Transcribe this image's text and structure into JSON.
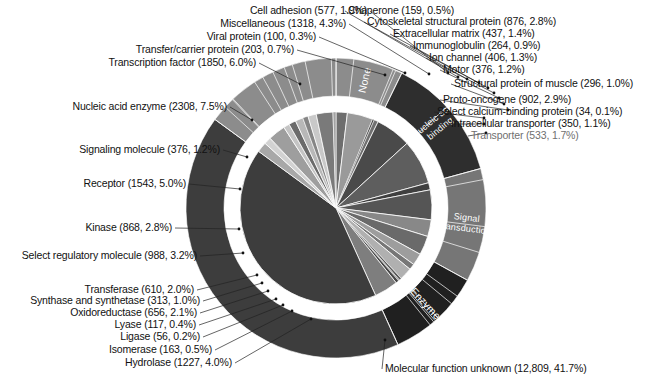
{
  "figure": {
    "title": "",
    "center": {
      "x": 336,
      "y": 208
    },
    "radii": {
      "pie": 96,
      "ring_inner": 112,
      "ring_outer": 150
    },
    "background": "#ffffff",
    "text_color": "#111111"
  },
  "ring_groups": [
    {
      "label": "None",
      "color": "#8c8c8c",
      "text_color": "#ffffff"
    },
    {
      "label": "Nucleic acid binding",
      "color": "#2e2e2e",
      "text_color": "#ffffff"
    },
    {
      "label": "Signal transduction",
      "color": "#767676",
      "text_color": "#ffffff"
    },
    {
      "label": "Enzyme",
      "color": "#202020",
      "text_color": "#ffffff"
    }
  ],
  "chart_data": {
    "type": "pie",
    "total": 30700,
    "value_label_format": "(count, percent)",
    "start_angle_deg": -90,
    "direction": "clockwise",
    "legend": "inline-leader-lines",
    "grid": false,
    "categories": [
      "Cell adhesion",
      "Miscellaneous",
      "Viral protein",
      "Transfer/carrier protein",
      "Transcription factor",
      "Nucleic acid enzyme",
      "Signaling molecule",
      "Receptor",
      "Kinase",
      "Select regulatory molecule",
      "Transferase",
      "Synthase and synthetase",
      "Oxidoreductase",
      "Lyase",
      "Ligase",
      "Isomerase",
      "Hydrolase",
      "Molecular function unknown",
      "Transporter",
      "Intracellular transporter",
      "Select calcium-binding protein",
      "Proto-oncogene",
      "Structural protein of muscle",
      "Motor",
      "Ion channel",
      "Immunoglobulin",
      "Extracellular matrix",
      "Cytoskeletal structural protein",
      "Chaperone"
    ],
    "values": [
      577,
      1318,
      100,
      203,
      1850,
      2308,
      376,
      1543,
      868,
      988,
      610,
      313,
      656,
      117,
      56,
      163,
      1227,
      12809,
      533,
      350,
      34,
      902,
      296,
      376,
      406,
      264,
      437,
      876,
      159
    ],
    "percents": [
      1.9,
      4.3,
      0.3,
      0.7,
      6.0,
      7.5,
      1.2,
      5.0,
      2.8,
      3.2,
      2.0,
      1.0,
      2.1,
      0.4,
      0.2,
      0.5,
      4.0,
      41.7,
      1.7,
      1.1,
      0.1,
      2.9,
      1.0,
      1.2,
      1.3,
      0.9,
      1.4,
      2.8,
      0.5
    ],
    "slices": [
      {
        "name": "Cell adhesion",
        "value": 577,
        "percent": 1.9,
        "color": "#6e6e6e",
        "group": "None",
        "label": "Cell adhesion (577, 1.9%)"
      },
      {
        "name": "Miscellaneous",
        "value": 1318,
        "percent": 4.3,
        "color": "#9a9a9a",
        "group": "None",
        "label": "Miscellaneous (1318, 4.3%)"
      },
      {
        "name": "Viral protein",
        "value": 100,
        "percent": 0.3,
        "color": "#3a3a3a",
        "group": "None",
        "label": "Viral protein (100, 0.3%)"
      },
      {
        "name": "Transfer/carrier protein",
        "value": 203,
        "percent": 0.7,
        "color": "#707070",
        "group": "None",
        "label": "Transfer/carrier protein (203, 0.7%)"
      },
      {
        "name": "Transcription factor",
        "value": 1850,
        "percent": 6.0,
        "color": "#4a4a4a",
        "group": "Nucleic acid binding",
        "label": "Transcription factor (1850, 6.0%)"
      },
      {
        "name": "Nucleic acid enzyme",
        "value": 2308,
        "percent": 7.5,
        "color": "#5e5e5e",
        "group": "Nucleic acid binding",
        "label": "Nucleic acid enzyme (2308, 7.5%)"
      },
      {
        "name": "Signaling molecule",
        "value": 376,
        "percent": 1.2,
        "color": "#3f3f3f",
        "group": "Signal transduction",
        "label": "Signaling molecule (376, 1.2%)"
      },
      {
        "name": "Receptor",
        "value": 1543,
        "percent": 5.0,
        "color": "#555555",
        "group": "Signal transduction",
        "label": "Receptor (1543, 5.0%)"
      },
      {
        "name": "Kinase",
        "value": 868,
        "percent": 2.8,
        "color": "#888888",
        "group": "Signal transduction",
        "label": "Kinase (868, 2.8%)"
      },
      {
        "name": "Select regulatory molecule",
        "value": 988,
        "percent": 3.2,
        "color": "#6a6a6a",
        "group": "Signal transduction",
        "label": "Select regulatory molecule (988, 3.2%)"
      },
      {
        "name": "Transferase",
        "value": 610,
        "percent": 2.0,
        "color": "#9d9d9d",
        "group": "Enzyme",
        "label": "Transferase (610, 2.0%)"
      },
      {
        "name": "Synthase and synthetase",
        "value": 313,
        "percent": 1.0,
        "color": "#777777",
        "group": "Enzyme",
        "label": "Synthase and synthetase (313, 1.0%)"
      },
      {
        "name": "Oxidoreductase",
        "value": 656,
        "percent": 2.1,
        "color": "#b0b0b0",
        "group": "Enzyme",
        "label": "Oxidoreductase (656, 2.1%)"
      },
      {
        "name": "Lyase",
        "value": 117,
        "percent": 0.4,
        "color": "#5a5a5a",
        "group": "Enzyme",
        "label": "Lyase (117, 0.4%)"
      },
      {
        "name": "Ligase",
        "value": 56,
        "percent": 0.2,
        "color": "#8e8e8e",
        "group": "Enzyme",
        "label": "Ligase (56, 0.2%)"
      },
      {
        "name": "Isomerase",
        "value": 163,
        "percent": 0.5,
        "color": "#454545",
        "group": "Enzyme",
        "label": "Isomerase (163, 0.5%)"
      },
      {
        "name": "Hydrolase",
        "value": 1227,
        "percent": 4.0,
        "color": "#7e7e7e",
        "group": "Enzyme",
        "label": "Hydrolase (1227, 4.0%)"
      },
      {
        "name": "Molecular function unknown",
        "value": 12809,
        "percent": 41.7,
        "color": "#3d3d3d",
        "group": "",
        "label": "Molecular function unknown (12,809, 41.7%)"
      },
      {
        "name": "Transporter",
        "value": 533,
        "percent": 1.7,
        "color": "#a8a8a8",
        "group": "None",
        "label": "Transporter (533, 1.7%)"
      },
      {
        "name": "Intracellular transporter",
        "value": 350,
        "percent": 1.1,
        "color": "#d2d2d2",
        "group": "None",
        "label": "Intracellular transporter (350, 1.1%)"
      },
      {
        "name": "Select calcium-binding protein",
        "value": 34,
        "percent": 0.1,
        "color": "#5d5d5d",
        "group": "None",
        "label": "Select calcium-binding protein (34, 0.1%)"
      },
      {
        "name": "Proto-oncogene",
        "value": 902,
        "percent": 2.9,
        "color": "#9e9e9e",
        "group": "None",
        "label": "Proto-oncogene (902, 2.9%)"
      },
      {
        "name": "Structural protein of muscle",
        "value": 296,
        "percent": 1.0,
        "color": "#c4c4c4",
        "group": "None",
        "label": "Structural protein of muscle (296, 1.0%)"
      },
      {
        "name": "Motor",
        "value": 376,
        "percent": 1.2,
        "color": "#6b6b6b",
        "group": "None",
        "label": "Motor (376, 1.2%)"
      },
      {
        "name": "Ion channel",
        "value": 406,
        "percent": 1.3,
        "color": "#b8b8b8",
        "group": "None",
        "label": "Ion channel (406, 1.3%)"
      },
      {
        "name": "Immunoglobulin",
        "value": 264,
        "percent": 0.9,
        "color": "#858585",
        "group": "None",
        "label": "Immunoglobulin (264, 0.9%)"
      },
      {
        "name": "Extracellular matrix",
        "value": 437,
        "percent": 1.4,
        "color": "#c9c9c9",
        "group": "None",
        "label": "Extracellular matrix (437, 1.4%)"
      },
      {
        "name": "Cytoskeletal structural protein",
        "value": 876,
        "percent": 2.8,
        "color": "#7a7a7a",
        "group": "None",
        "label": "Cytoskeletal structural protein (876, 2.8%)"
      },
      {
        "name": "Chaperone",
        "value": 159,
        "percent": 0.5,
        "color": "#a3a3a3",
        "group": "None",
        "label": "Chaperone (159, 0.5%)"
      }
    ]
  },
  "labels": {
    "top_left": [
      {
        "text": "Cell adhesion (577, 1.9%)",
        "x": 367,
        "y": 5,
        "align": "right",
        "anchor": {
          "x": 448,
          "y": 73
        }
      },
      {
        "text": "Miscellaneous (1318, 4.3%)",
        "x": 346,
        "y": 18,
        "align": "right",
        "anchor": {
          "x": 429,
          "y": 74
        }
      },
      {
        "text": "Viral protein (100, 0.3%)",
        "x": 316,
        "y": 31,
        "align": "right",
        "anchor": {
          "x": 405,
          "y": 73
        }
      },
      {
        "text": "Transfer/carrier protein (203, 0.7%)",
        "x": 294,
        "y": 44,
        "align": "right",
        "anchor": {
          "x": 385,
          "y": 75
        }
      },
      {
        "text": "Transcription factor (1850, 6.0%)",
        "x": 256,
        "y": 57,
        "align": "right",
        "anchor": {
          "x": 300,
          "y": 84
        }
      }
    ],
    "left": [
      {
        "text": "Nucleic acid enzyme (2308, 7.5%)",
        "x": 227,
        "y": 101,
        "align": "right",
        "anchor": {
          "x": 252,
          "y": 120
        }
      },
      {
        "text": "Signaling molecule (376, 1.2%)",
        "x": 220,
        "y": 144,
        "align": "right",
        "anchor": {
          "x": 247,
          "y": 157
        }
      },
      {
        "text": "Receptor (1543, 5.0%)",
        "x": 186,
        "y": 178,
        "align": "right",
        "anchor": {
          "x": 240,
          "y": 189
        }
      },
      {
        "text": "Kinase (868, 2.8%)",
        "x": 172,
        "y": 222,
        "align": "right",
        "anchor": {
          "x": 239,
          "y": 229
        }
      },
      {
        "text": "Select regulatory molecule (988, 3.2%)",
        "x": 197,
        "y": 250,
        "align": "right",
        "anchor": {
          "x": 243,
          "y": 253
        }
      }
    ],
    "bottom_left": [
      {
        "text": "Transferase (610, 2.0%)",
        "x": 194,
        "y": 284,
        "align": "right",
        "anchor": {
          "x": 257,
          "y": 275
        }
      },
      {
        "text": "Synthase and synthetase (313, 1.0%)",
        "x": 200,
        "y": 295,
        "align": "right",
        "anchor": {
          "x": 262,
          "y": 283
        }
      },
      {
        "text": "Oxidoreductase (656, 2.1%)",
        "x": 197,
        "y": 307,
        "align": "right",
        "anchor": {
          "x": 268,
          "y": 291
        }
      },
      {
        "text": "Lyase (117, 0.4%)",
        "x": 196,
        "y": 319,
        "align": "right",
        "anchor": {
          "x": 276,
          "y": 299
        }
      },
      {
        "text": "Ligase (56, 0.2%)",
        "x": 200,
        "y": 331,
        "align": "right",
        "anchor": {
          "x": 283,
          "y": 305
        }
      },
      {
        "text": "Isomerase (163, 0.5%)",
        "x": 212,
        "y": 344,
        "align": "right",
        "anchor": {
          "x": 292,
          "y": 311
        }
      },
      {
        "text": "Hydrolase (1227, 4.0%)",
        "x": 232,
        "y": 357,
        "align": "right",
        "anchor": {
          "x": 311,
          "y": 319
        }
      }
    ],
    "right": [
      {
        "text": "Chaperone (159, 0.5%)",
        "x": 348,
        "y": 5,
        "align": "left",
        "anchor": {
          "x": 458,
          "y": 77
        }
      },
      {
        "text": "Cytoskeletal structural protein (876, 2.8%)",
        "x": 367,
        "y": 16,
        "align": "left",
        "anchor": {
          "x": 467,
          "y": 79
        }
      },
      {
        "text": "Extracellular matrix (437, 1.4%)",
        "x": 393,
        "y": 28,
        "align": "left",
        "anchor": {
          "x": 479,
          "y": 83
        }
      },
      {
        "text": "Immunoglobulin (264, 0.9%)",
        "x": 413,
        "y": 40,
        "align": "left",
        "anchor": {
          "x": 488,
          "y": 88
        }
      },
      {
        "text": "Ion channel (406, 1.3%)",
        "x": 429,
        "y": 52,
        "align": "left",
        "anchor": {
          "x": 494,
          "y": 93
        }
      },
      {
        "text": "Motor (376, 1.2%)",
        "x": 443,
        "y": 64,
        "align": "left",
        "anchor": {
          "x": 499,
          "y": 98
        }
      },
      {
        "text": "Structural protein of muscle (296, 1.0%)",
        "x": 454,
        "y": 78,
        "align": "left",
        "anchor": {
          "x": 504,
          "y": 104
        }
      },
      {
        "text": "Proto-oncogene (902, 2.9%)",
        "x": 443,
        "y": 94,
        "align": "left",
        "anchor": {
          "x": 508,
          "y": 110
        }
      },
      {
        "text": "Select calcium-binding protein (34, 0.1%)",
        "x": 437,
        "y": 106,
        "align": "left",
        "anchor": {
          "x": 484,
          "y": 118
        }
      },
      {
        "text": "Intracellular transporter (350, 1.1%)",
        "x": 451,
        "y": 118,
        "align": "left",
        "anchor": {
          "x": 484,
          "y": 124
        }
      },
      {
        "text": "Transporter (533, 1.7%)",
        "x": 471,
        "y": 130,
        "align": "left",
        "anchor": {
          "x": 486,
          "y": 133
        },
        "faded": true
      }
    ],
    "bottom_right": [
      {
        "text": "Molecular function unknown (12,809, 41.7%)",
        "x": 385,
        "y": 363,
        "align": "left",
        "anchor": {
          "x": 385,
          "y": 340
        }
      }
    ]
  }
}
